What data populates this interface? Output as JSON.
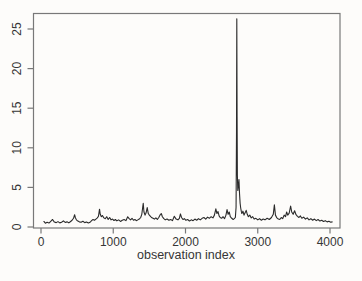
{
  "chart_data": {
    "type": "line",
    "title": "",
    "xlabel": "observation index",
    "ylabel": "",
    "xlim": [
      0,
      4000
    ],
    "ylim": [
      0,
      27
    ],
    "xticks": [
      0,
      1000,
      2000,
      3000,
      4000
    ],
    "yticks": [
      0,
      5,
      10,
      15,
      20,
      25
    ],
    "grid": false,
    "legend_position": "none",
    "frame_color": "#787878",
    "line_color": "#2b2b2b",
    "background_color": "#fdfcfa",
    "max_point": {
      "x": 2710,
      "y": 26.3
    },
    "series": [
      {
        "name": "series",
        "color": "#2b2b2b",
        "points": [
          [
            40,
            0.7
          ],
          [
            60,
            0.48
          ],
          [
            85,
            0.6
          ],
          [
            110,
            0.5
          ],
          [
            135,
            0.72
          ],
          [
            160,
            0.95
          ],
          [
            185,
            0.62
          ],
          [
            210,
            0.55
          ],
          [
            235,
            0.68
          ],
          [
            260,
            0.52
          ],
          [
            285,
            0.6
          ],
          [
            310,
            0.78
          ],
          [
            335,
            0.58
          ],
          [
            360,
            0.65
          ],
          [
            385,
            0.52
          ],
          [
            410,
            0.7
          ],
          [
            430,
            0.85
          ],
          [
            450,
            1.1
          ],
          [
            465,
            1.55
          ],
          [
            475,
            1.2
          ],
          [
            490,
            0.9
          ],
          [
            510,
            0.75
          ],
          [
            530,
            0.65
          ],
          [
            555,
            0.6
          ],
          [
            580,
            0.72
          ],
          [
            605,
            0.55
          ],
          [
            630,
            0.62
          ],
          [
            655,
            0.5
          ],
          [
            680,
            0.6
          ],
          [
            700,
            0.8
          ],
          [
            720,
            0.95
          ],
          [
            740,
            0.85
          ],
          [
            760,
            1.0
          ],
          [
            780,
            1.15
          ],
          [
            795,
            1.35
          ],
          [
            810,
            2.25
          ],
          [
            820,
            1.6
          ],
          [
            835,
            1.3
          ],
          [
            850,
            1.45
          ],
          [
            870,
            1.15
          ],
          [
            890,
            1.05
          ],
          [
            910,
            1.3
          ],
          [
            930,
            0.95
          ],
          [
            950,
            1.2
          ],
          [
            970,
            0.9
          ],
          [
            990,
            1.0
          ],
          [
            1010,
            0.82
          ],
          [
            1030,
            0.95
          ],
          [
            1050,
            0.78
          ],
          [
            1075,
            0.9
          ],
          [
            1100,
            0.7
          ],
          [
            1125,
            0.85
          ],
          [
            1150,
            0.95
          ],
          [
            1175,
            0.8
          ],
          [
            1200,
            1.3
          ],
          [
            1220,
            1.05
          ],
          [
            1240,
            0.9
          ],
          [
            1260,
            1.1
          ],
          [
            1280,
            0.85
          ],
          [
            1300,
            0.95
          ],
          [
            1320,
            0.8
          ],
          [
            1340,
            0.9
          ],
          [
            1360,
            1.0
          ],
          [
            1380,
            1.2
          ],
          [
            1395,
            1.6
          ],
          [
            1405,
            2.3
          ],
          [
            1415,
            3.0
          ],
          [
            1425,
            1.9
          ],
          [
            1440,
            1.5
          ],
          [
            1455,
            1.8
          ],
          [
            1470,
            2.45
          ],
          [
            1485,
            1.7
          ],
          [
            1500,
            1.5
          ],
          [
            1515,
            1.35
          ],
          [
            1530,
            1.2
          ],
          [
            1550,
            1.1
          ],
          [
            1570,
            1.0
          ],
          [
            1590,
            1.15
          ],
          [
            1610,
            0.95
          ],
          [
            1630,
            1.2
          ],
          [
            1650,
            1.55
          ],
          [
            1665,
            1.7
          ],
          [
            1680,
            1.3
          ],
          [
            1700,
            1.05
          ],
          [
            1720,
            0.9
          ],
          [
            1745,
            1.0
          ],
          [
            1770,
            0.85
          ],
          [
            1795,
            0.95
          ],
          [
            1820,
            0.8
          ],
          [
            1845,
            1.35
          ],
          [
            1870,
            1.0
          ],
          [
            1895,
            0.9
          ],
          [
            1915,
            1.1
          ],
          [
            1930,
            1.65
          ],
          [
            1945,
            1.2
          ],
          [
            1965,
            0.95
          ],
          [
            1985,
            1.05
          ],
          [
            2005,
            0.85
          ],
          [
            2030,
            0.95
          ],
          [
            2055,
            0.75
          ],
          [
            2080,
            0.9
          ],
          [
            2105,
            0.8
          ],
          [
            2130,
            1.0
          ],
          [
            2155,
            0.85
          ],
          [
            2180,
            1.05
          ],
          [
            2205,
            0.9
          ],
          [
            2230,
            1.1
          ],
          [
            2255,
            1.2
          ],
          [
            2280,
            1.0
          ],
          [
            2305,
            1.25
          ],
          [
            2330,
            1.1
          ],
          [
            2355,
            1.3
          ],
          [
            2380,
            1.15
          ],
          [
            2400,
            1.5
          ],
          [
            2420,
            2.3
          ],
          [
            2435,
            1.7
          ],
          [
            2450,
            1.95
          ],
          [
            2465,
            1.4
          ],
          [
            2480,
            1.2
          ],
          [
            2500,
            1.1
          ],
          [
            2520,
            1.3
          ],
          [
            2540,
            1.05
          ],
          [
            2560,
            1.5
          ],
          [
            2575,
            2.2
          ],
          [
            2590,
            1.6
          ],
          [
            2605,
            1.9
          ],
          [
            2620,
            1.3
          ],
          [
            2640,
            1.1
          ],
          [
            2660,
            0.95
          ],
          [
            2675,
            1.05
          ],
          [
            2690,
            1.2
          ],
          [
            2700,
            2.5
          ],
          [
            2706,
            12.0
          ],
          [
            2710,
            26.3
          ],
          [
            2714,
            14.0
          ],
          [
            2718,
            6.5
          ],
          [
            2724,
            4.6
          ],
          [
            2732,
            5.2
          ],
          [
            2740,
            6.0
          ],
          [
            2748,
            4.2
          ],
          [
            2756,
            3.0
          ],
          [
            2764,
            2.4
          ],
          [
            2772,
            2.0
          ],
          [
            2780,
            1.7
          ],
          [
            2795,
            2.0
          ],
          [
            2810,
            1.5
          ],
          [
            2825,
            1.8
          ],
          [
            2840,
            2.1
          ],
          [
            2855,
            1.6
          ],
          [
            2870,
            1.3
          ],
          [
            2890,
            1.5
          ],
          [
            2910,
            1.15
          ],
          [
            2930,
            1.3
          ],
          [
            2950,
            1.0
          ],
          [
            2975,
            1.1
          ],
          [
            3000,
            0.9
          ],
          [
            3025,
            1.05
          ],
          [
            3050,
            0.85
          ],
          [
            3075,
            1.0
          ],
          [
            3100,
            0.9
          ],
          [
            3130,
            1.1
          ],
          [
            3160,
            0.95
          ],
          [
            3190,
            1.2
          ],
          [
            3215,
            1.6
          ],
          [
            3230,
            2.8
          ],
          [
            3245,
            1.5
          ],
          [
            3265,
            1.15
          ],
          [
            3285,
            1.0
          ],
          [
            3305,
            0.95
          ],
          [
            3325,
            1.2
          ],
          [
            3345,
            1.05
          ],
          [
            3365,
            1.5
          ],
          [
            3385,
            1.3
          ],
          [
            3400,
            1.9
          ],
          [
            3415,
            1.5
          ],
          [
            3435,
            1.75
          ],
          [
            3455,
            2.65
          ],
          [
            3470,
            1.9
          ],
          [
            3490,
            1.6
          ],
          [
            3510,
            2.05
          ],
          [
            3530,
            1.55
          ],
          [
            3550,
            1.35
          ],
          [
            3570,
            1.2
          ],
          [
            3590,
            1.4
          ],
          [
            3610,
            1.1
          ],
          [
            3635,
            1.25
          ],
          [
            3660,
            1.0
          ],
          [
            3685,
            1.15
          ],
          [
            3710,
            0.9
          ],
          [
            3735,
            1.05
          ],
          [
            3760,
            0.85
          ],
          [
            3785,
            1.0
          ],
          [
            3810,
            0.8
          ],
          [
            3835,
            0.95
          ],
          [
            3860,
            0.75
          ],
          [
            3885,
            0.85
          ],
          [
            3910,
            0.7
          ],
          [
            3935,
            0.8
          ],
          [
            3960,
            0.65
          ],
          [
            3985,
            0.72
          ],
          [
            4010,
            0.6
          ],
          [
            4030,
            0.65
          ]
        ]
      }
    ]
  }
}
